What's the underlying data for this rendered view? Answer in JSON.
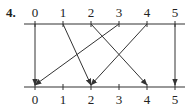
{
  "exercise": {
    "number_label": "4."
  },
  "diagram": {
    "type": "mapping-diagram",
    "top_line": {
      "y": 24,
      "x_start": 24,
      "x_end": 185,
      "ticks": [
        {
          "label": "0",
          "x": 35
        },
        {
          "label": "1",
          "x": 63
        },
        {
          "label": "2",
          "x": 91
        },
        {
          "label": "3",
          "x": 119
        },
        {
          "label": "4",
          "x": 147
        },
        {
          "label": "5",
          "x": 175
        }
      ]
    },
    "bottom_line": {
      "y": 87,
      "x_start": 24,
      "x_end": 185,
      "ticks": [
        {
          "label": "0",
          "x": 35
        },
        {
          "label": "1",
          "x": 63
        },
        {
          "label": "2",
          "x": 91
        },
        {
          "label": "3",
          "x": 119
        },
        {
          "label": "4",
          "x": 147
        },
        {
          "label": "5",
          "x": 175
        }
      ]
    },
    "mappings": [
      {
        "from": 0,
        "to": 0
      },
      {
        "from": 1,
        "to": 2
      },
      {
        "from": 2,
        "to": 4
      },
      {
        "from": 3,
        "to": 0
      },
      {
        "from": 4,
        "to": 2
      },
      {
        "from": 5,
        "to": 5
      }
    ],
    "colors": {
      "line": "#333333",
      "text": "#222222"
    }
  }
}
